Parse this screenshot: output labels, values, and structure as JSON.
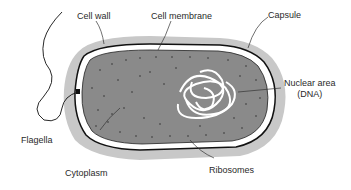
{
  "diagram": {
    "labels": {
      "cell_wall": "Cell wall",
      "cell_membrane": "Cell membrane",
      "capsule": "Capsule",
      "nuclear_area_line1": "Nuclear area",
      "nuclear_area_line2": "(DNA)",
      "flagella": "Flagella",
      "cytoplasm": "Cytoplasm",
      "ribosomes": "Ribosomes"
    },
    "colors": {
      "capsule": "#c8c8c8",
      "cytoplasm": "#8a8a8a",
      "membrane_gap": "#ffffff",
      "outline": "#111111",
      "dna": "#ffffff",
      "text": "#2a2a2a"
    }
  }
}
